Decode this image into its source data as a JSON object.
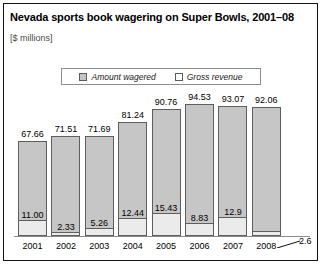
{
  "header": {
    "title": "Nevada sports book wagering on Super Bowls, 2001–08",
    "subtitle": "[$ millions]"
  },
  "legend": {
    "items": [
      {
        "label": "Amount wagered",
        "swatch": "gray",
        "color": "#c6c6c6"
      },
      {
        "label": "Gross revenue",
        "swatch": "white",
        "color": "#ffffff"
      }
    ]
  },
  "callout": {
    "value_label": "2.6",
    "for_year": "2008"
  },
  "chart_data": {
    "type": "bar",
    "title": "Nevada sports book wagering on Super Bowls, 2001–08",
    "subtitle": "[$ millions]",
    "xlabel": "",
    "ylabel": "$ millions",
    "ylim": [
      0,
      100
    ],
    "grid": false,
    "legend_position": "top-center",
    "categories": [
      "2001",
      "2002",
      "2003",
      "2004",
      "2005",
      "2006",
      "2007",
      "2008"
    ],
    "series": [
      {
        "name": "Amount wagered",
        "values": [
          67.66,
          71.51,
          71.69,
          81.24,
          90.76,
          94.53,
          93.07,
          92.06
        ],
        "labels": [
          "67.66",
          "71.51",
          "71.69",
          "81.24",
          "90.76",
          "94.53",
          "93.07",
          "92.06"
        ],
        "color": "#c6c6c6"
      },
      {
        "name": "Gross revenue",
        "values": [
          11.0,
          2.33,
          5.26,
          12.44,
          15.43,
          8.83,
          12.9,
          2.6
        ],
        "labels": [
          "11.00",
          "2.33",
          "5.26",
          "12.44",
          "15.43",
          "8.83",
          "12.9",
          "2.6"
        ],
        "color": "#ebebeb"
      }
    ]
  }
}
